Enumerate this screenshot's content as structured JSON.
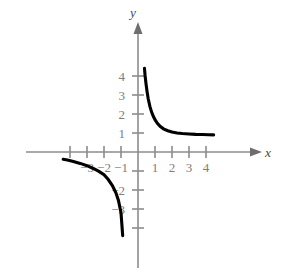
{
  "figure": {
    "title": "",
    "background_color": "#ffffff",
    "curve_color": "#000000",
    "axis_color": "#8c8c8c",
    "label_color": "#7d7d7d"
  },
  "chart_data": {
    "type": "line",
    "title": "",
    "subtitle": "",
    "xlabel": "x",
    "ylabel": "y",
    "function": "y = 1/x",
    "grid": false,
    "legend": false,
    "xlim": [
      -4.6,
      4.8
    ],
    "ylim": [
      -4.6,
      4.7
    ],
    "x_ticks": [
      -4,
      -3,
      -2,
      -1,
      1,
      2,
      3,
      4
    ],
    "x_tick_labels": [
      "",
      "−3",
      "−2",
      "−1",
      "1",
      "2",
      "3",
      "4"
    ],
    "y_ticks": [
      -4,
      -3,
      -2,
      -1,
      1,
      2,
      3,
      4
    ],
    "y_tick_labels": [
      "",
      "−3",
      "−2",
      "",
      "1",
      "2",
      "3",
      "4"
    ],
    "series": [
      {
        "name": "branch-upper-right",
        "x": [
          0.38,
          0.42,
          0.47,
          0.53,
          0.6,
          0.7,
          0.8,
          0.9,
          1.0,
          1.15,
          1.3,
          1.5,
          1.75,
          2.0,
          2.3,
          2.6,
          3.0,
          3.4,
          3.8,
          4.15,
          4.45
        ],
        "y": [
          4.4,
          4.0,
          3.6,
          3.2,
          2.8,
          2.4,
          2.1,
          1.88,
          1.7,
          1.5,
          1.35,
          1.22,
          1.12,
          1.05,
          1.0,
          0.97,
          0.95,
          0.93,
          0.92,
          0.91,
          0.9
        ]
      },
      {
        "name": "branch-lower-left",
        "x": [
          -4.4,
          -4.15,
          -3.8,
          -3.4,
          -3.0,
          -2.6,
          -2.3,
          -2.0,
          -1.75,
          -1.5,
          -1.3,
          -1.15,
          -1.0,
          -0.9
        ],
        "y": [
          -0.38,
          -0.42,
          -0.5,
          -0.6,
          -0.72,
          -0.88,
          -1.02,
          -1.2,
          -1.45,
          -1.78,
          -2.15,
          -2.55,
          -3.2,
          -4.4
        ]
      }
    ],
    "annotations": []
  },
  "axis_labels": {
    "x_axis_name": "x",
    "y_axis_name": "y"
  },
  "x_tick_text": {
    "m3": "−3",
    "m2": "−2",
    "m1": "−1",
    "p1": "1",
    "p2": "2",
    "p3": "3",
    "p4": "4"
  },
  "y_tick_text": {
    "p4": "4",
    "p3": "3",
    "p2": "2",
    "p1": "1",
    "m2": "−2",
    "m3": "−3"
  }
}
